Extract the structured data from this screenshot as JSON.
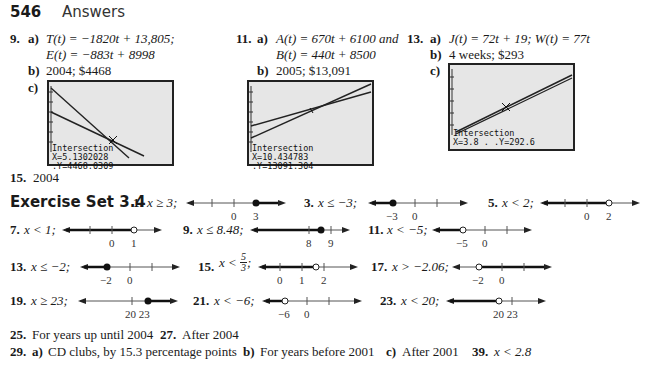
{
  "header": {
    "page_number": "546",
    "title": "Answers"
  },
  "problems_top": [
    {
      "num": "9.",
      "a_label": "a)",
      "a_line1": "T(t) = −1820t + 13,805;",
      "a_line2": "E(t) = −883t + 8998",
      "b_label": "b)",
      "b_text": "2004; $4468",
      "c_label": "c)",
      "screen": {
        "title": "Intersection",
        "readout": "X=5.1302028  .Y=4468.0309"
      }
    },
    {
      "num": "11.",
      "a_label": "a)",
      "a_line1": "A(t) = 670t + 6100 and",
      "a_line2": "B(t) = 440t + 8500",
      "b_label": "b)",
      "b_text": "2005; $13,091",
      "c_label": "c)",
      "screen": {
        "title": "Intersection",
        "readout": "X=10.434783 .Y=13091.304"
      }
    },
    {
      "num": "13.",
      "a_label": "a)",
      "a_line1": "J(t) = 72t + 19; W(t) = 77t",
      "b_label": "b)",
      "b_text": "4 weeks; $293",
      "c_label": "c)",
      "screen": {
        "title": "Intersection",
        "readout": "X=3.8  .    .Y=292.6"
      }
    }
  ],
  "problem15": {
    "num": "15.",
    "text": "2004"
  },
  "exercise_set": {
    "title": "Exercise Set 3.4",
    "items": [
      {
        "num": "1.",
        "ineq": "x ≥ 3;",
        "ticks": [
          "0",
          "3"
        ]
      },
      {
        "num": "3.",
        "ineq": "x ≤ −3;",
        "ticks": [
          "−3",
          "0"
        ]
      },
      {
        "num": "5.",
        "ineq": "x < 2;",
        "ticks": [
          "0",
          "2"
        ]
      },
      {
        "num": "7.",
        "ineq": "x < 1;",
        "ticks": [
          "0",
          "1"
        ]
      },
      {
        "num": "9.",
        "ineq": "x ≤ 8.48;",
        "ticks": [
          "8",
          "9"
        ]
      },
      {
        "num": "11.",
        "ineq": "x < −5;",
        "ticks": [
          "−5",
          "0"
        ]
      },
      {
        "num": "13.",
        "ineq": "x ≤ −2;",
        "ticks": [
          "−2",
          "0"
        ]
      },
      {
        "num": "15.",
        "ineq_prefix": "x <",
        "frac_num": "5",
        "frac_den": "3",
        "ineq_suffix": ";",
        "ticks": [
          "0",
          "1",
          "2"
        ]
      },
      {
        "num": "17.",
        "ineq": "x > −2.06;",
        "ticks": [
          "−2",
          "0"
        ]
      },
      {
        "num": "19.",
        "ineq": "x ≥ 23;",
        "ticks": [
          "20 23"
        ]
      },
      {
        "num": "21.",
        "ineq": "x < −6;",
        "ticks": [
          "−6",
          "0"
        ]
      },
      {
        "num": "23.",
        "ineq": "x < 20;",
        "ticks": [
          "20 23"
        ]
      }
    ]
  },
  "bottom": {
    "p25_num": "25.",
    "p25_text": "For years up until 2004",
    "p27_num": "27.",
    "p27_text": "After 2004",
    "p29_num": "29.",
    "p29_a_label": "a)",
    "p29_a_text": "CD clubs, by 15.3 percentage points",
    "p29_b_label": "b)",
    "p29_b_text": "For years before 2001",
    "p29_c_label": "c)",
    "p29_c_text": "After 2001",
    "p39_num": "39.",
    "p39_text": "x < 2.8"
  },
  "colors": {
    "screen_bg": "#e6e6e6",
    "text": "#1a1a1a"
  }
}
